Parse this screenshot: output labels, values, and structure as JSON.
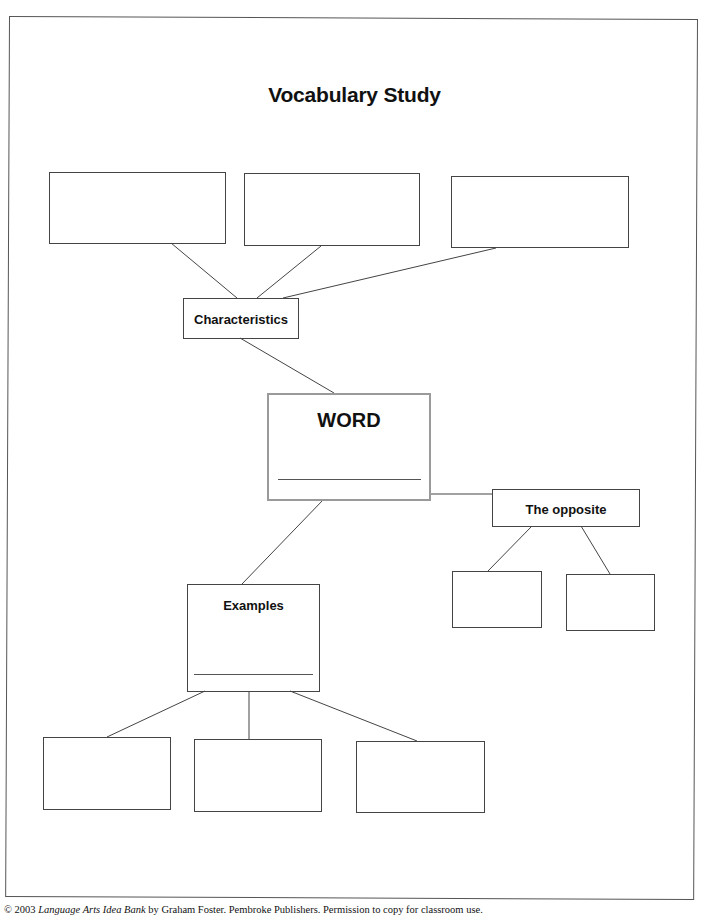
{
  "title": "Vocabulary Study",
  "nodes": {
    "characteristics": "Characteristics",
    "word": "WORD",
    "opposite": "The opposite",
    "examples": "Examples"
  },
  "blank_boxes": {
    "characteristics_children": 3,
    "opposite_children": 2,
    "examples_children": 3
  },
  "footer": {
    "prefix": "© 2003 ",
    "book_title": "Language Arts Idea Bank",
    "suffix": " by Graham Foster. Pembroke Publishers. Permission to copy for classroom use."
  }
}
